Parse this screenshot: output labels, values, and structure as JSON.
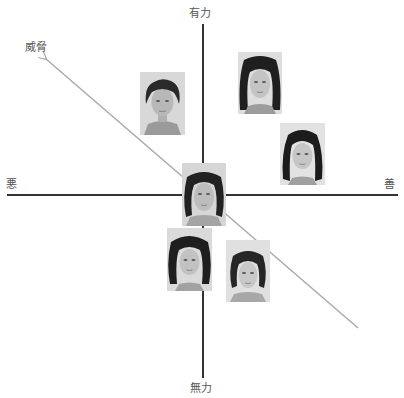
{
  "diagram": {
    "type": "two-dimensional face evaluation space",
    "axes": {
      "vertical": {
        "top_label": "有力",
        "bottom_label": "無力",
        "color": "#333333"
      },
      "horizontal": {
        "left_label": "悪",
        "right_label": "善",
        "color": "#333333"
      },
      "diagonal": {
        "label": "威脅",
        "direction": "toward upper-left (悪 + 有力)",
        "color": "#aaaaaa"
      }
    },
    "faces": [
      {
        "id": "face-1",
        "description": "man with curly hair",
        "quadrant": "upper-left (悪/有力)",
        "hair": "#2a2a2a",
        "skin": "#b8b8b8",
        "bg": "#d8d8d8"
      },
      {
        "id": "face-2",
        "description": "woman with long dark hair",
        "quadrant": "upper-right (善/有力)",
        "hair": "#1f1f1f",
        "skin": "#c4c4c4",
        "bg": "#dedede"
      },
      {
        "id": "face-3",
        "description": "woman with dark shoulder-length hair",
        "quadrant": "upper-right (善/有力), near horizontal axis",
        "hair": "#1c1c1c",
        "skin": "#c6c6c6",
        "bg": "#e2e2e2"
      },
      {
        "id": "face-4",
        "description": "young man with medium-length hair",
        "quadrant": "center (origin)",
        "hair": "#222222",
        "skin": "#bdbdbd",
        "bg": "#d6d6d6"
      },
      {
        "id": "face-5",
        "description": "woman with curly dark hair",
        "quadrant": "lower-left (悪/無力)",
        "hair": "#1e1e1e",
        "skin": "#c2c2c2",
        "bg": "#dadada"
      },
      {
        "id": "face-6",
        "description": "woman with short dark hair",
        "quadrant": "lower-right (善/無力)",
        "hair": "#262626",
        "skin": "#c8c8c8",
        "bg": "#e0e0e0"
      }
    ]
  }
}
